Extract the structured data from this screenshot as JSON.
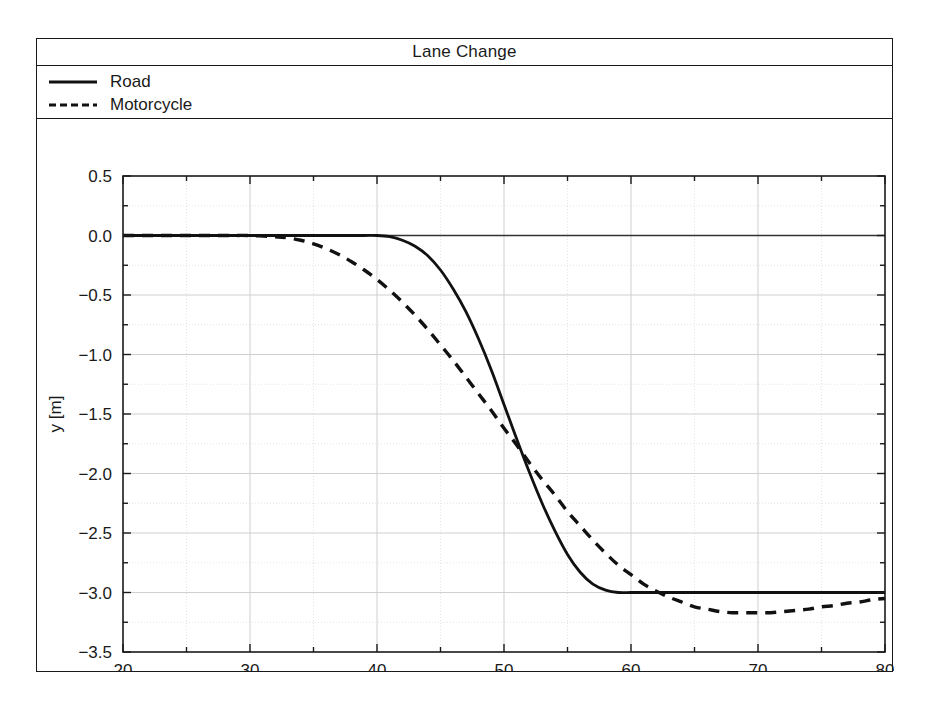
{
  "figure": {
    "title": "Lane Change"
  },
  "legend": {
    "entries": [
      {
        "label": "Road",
        "style": "solid",
        "color": "#111111"
      },
      {
        "label": "Motorcycle",
        "style": "dashed",
        "color": "#111111"
      }
    ]
  },
  "axes": {
    "x_title": "Coordinate [m]",
    "y_title": "y [m]",
    "x_ticks": [
      "20",
      "30",
      "40",
      "50",
      "60",
      "70",
      "80"
    ],
    "y_ticks": [
      "0.5",
      "0.0",
      "−0.5",
      "−1.0",
      "−1.5",
      "−2.0",
      "−2.5",
      "−3.0",
      "−3.5"
    ]
  },
  "chart_data": {
    "type": "line",
    "title": "Lane Change",
    "xlabel": "Coordinate [m]",
    "ylabel": "y [m]",
    "xlim": [
      20,
      80
    ],
    "ylim": [
      -3.5,
      0.5
    ],
    "xticks": [
      20,
      30,
      40,
      50,
      60,
      70,
      80
    ],
    "yticks": [
      0.5,
      0.0,
      -0.5,
      -1.0,
      -1.5,
      -2.0,
      -2.5,
      -3.0,
      -3.5
    ],
    "x_minor_step": 5,
    "y_minor_step": 0.25,
    "grid": true,
    "legend_position": "top-left-outside",
    "zero_reference_line": 0.0,
    "series": [
      {
        "name": "Road",
        "style": "solid",
        "color": "#111111",
        "x": [
          20,
          22,
          24,
          26,
          28,
          30,
          32,
          34,
          36,
          38,
          39,
          40,
          41,
          42,
          43,
          44,
          45,
          46,
          47,
          48,
          49,
          50,
          51,
          52,
          53,
          54,
          55,
          56,
          57,
          58,
          59,
          60,
          61,
          62,
          64,
          66,
          68,
          70,
          72,
          74,
          76,
          78,
          80
        ],
        "y": [
          0.0,
          0.0,
          0.0,
          0.0,
          0.0,
          0.0,
          0.0,
          0.0,
          0.0,
          0.0,
          0.0,
          0.0,
          -0.01,
          -0.04,
          -0.09,
          -0.17,
          -0.29,
          -0.45,
          -0.64,
          -0.87,
          -1.13,
          -1.42,
          -1.71,
          -1.99,
          -2.25,
          -2.48,
          -2.68,
          -2.83,
          -2.93,
          -2.98,
          -3.0,
          -3.0,
          -3.0,
          -3.0,
          -3.0,
          -3.0,
          -3.0,
          -3.0,
          -3.0,
          -3.0,
          -3.0,
          -3.0,
          -3.0
        ]
      },
      {
        "name": "Motorcycle",
        "style": "dashed",
        "color": "#111111",
        "x": [
          20,
          22,
          24,
          26,
          28,
          30,
          32,
          33,
          34,
          35,
          36,
          37,
          38,
          39,
          40,
          41,
          42,
          43,
          44,
          45,
          46,
          47,
          48,
          49,
          50,
          51,
          52,
          53,
          54,
          55,
          56,
          57,
          58,
          59,
          60,
          61,
          62,
          63,
          64,
          65,
          66,
          67,
          68,
          69,
          70,
          71,
          72,
          73,
          74,
          75,
          76,
          77,
          78,
          79,
          80
        ],
        "y": [
          0.0,
          0.0,
          0.0,
          0.0,
          0.0,
          0.0,
          -0.01,
          -0.02,
          -0.04,
          -0.07,
          -0.11,
          -0.16,
          -0.22,
          -0.29,
          -0.37,
          -0.46,
          -0.56,
          -0.67,
          -0.79,
          -0.92,
          -1.05,
          -1.19,
          -1.33,
          -1.47,
          -1.62,
          -1.76,
          -1.91,
          -2.05,
          -2.18,
          -2.32,
          -2.44,
          -2.56,
          -2.67,
          -2.77,
          -2.85,
          -2.93,
          -2.99,
          -3.04,
          -3.08,
          -3.12,
          -3.14,
          -3.16,
          -3.17,
          -3.17,
          -3.17,
          -3.17,
          -3.16,
          -3.15,
          -3.14,
          -3.12,
          -3.11,
          -3.09,
          -3.08,
          -3.06,
          -3.05
        ]
      }
    ]
  }
}
